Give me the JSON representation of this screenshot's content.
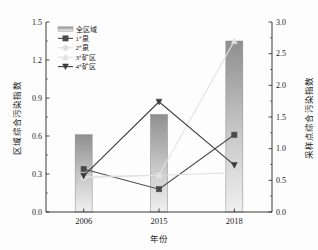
{
  "chart_data": {
    "type": "bar",
    "title": "",
    "subtitle": "",
    "xlabel": "年份",
    "ylabel": "区域综合污染指数",
    "ylabel_right": "采样点综合污染指数",
    "categories": [
      "2006",
      "2015",
      "2018"
    ],
    "ylim": [
      0.0,
      1.5
    ],
    "ylim_right": [
      0.0,
      3.0
    ],
    "yticks": [
      "0.0",
      "0.3",
      "0.6",
      "0.9",
      "1.2",
      "1.5"
    ],
    "ytick_values": [
      0.0,
      0.3,
      0.6,
      0.9,
      1.2,
      1.5
    ],
    "yticks_right": [
      "0.0",
      "0.5",
      "1.0",
      "1.5",
      "2.0",
      "2.5",
      "3.0"
    ],
    "ytick_values_right": [
      0.0,
      0.5,
      1.0,
      1.5,
      2.0,
      2.5,
      3.0
    ],
    "grid": false,
    "legend_position": "upper-left",
    "bar_series": {
      "name": "全区域",
      "axis": "left",
      "values": [
        0.61,
        0.77,
        1.35
      ],
      "color": "#9a9a9a"
    },
    "series": [
      {
        "name": "1#泉",
        "label_main": "泉",
        "label_num": "1",
        "label_sup": "#",
        "axis": "right",
        "values": [
          0.68,
          0.36,
          1.22
        ],
        "values_left_scale": [
          0.34,
          0.18,
          0.61
        ],
        "color": "#4a4a4a",
        "marker": "square"
      },
      {
        "name": "2#泉",
        "label_main": "泉",
        "label_num": "2",
        "label_sup": "#",
        "axis": "right",
        "values": [
          0.54,
          0.58,
          0.62
        ],
        "values_left_scale": [
          0.27,
          0.29,
          0.31
        ],
        "color": "#dedede",
        "marker": "circle"
      },
      {
        "name": "3#矿区",
        "label_main": "矿区",
        "label_num": "3",
        "label_sup": "#",
        "axis": "right",
        "values": [
          0.56,
          0.58,
          2.7
        ],
        "values_left_scale": [
          0.28,
          0.29,
          1.35
        ],
        "color": "#e2e2e2",
        "marker": "triangle-up"
      },
      {
        "name": "4#矿区",
        "label_main": "矿区",
        "label_num": "4",
        "label_sup": "#",
        "axis": "right",
        "values": [
          0.57,
          1.74,
          0.74
        ],
        "values_left_scale": [
          0.285,
          0.87,
          0.37
        ],
        "color": "#3c3c3c",
        "marker": "triangle-down"
      }
    ],
    "legend_entries": [
      {
        "name": "全区域",
        "type": "bar",
        "num": "",
        "sup": "",
        "text": "全区域"
      },
      {
        "name": "1#泉",
        "type": "line-square",
        "num": "1",
        "sup": "#",
        "text": "泉"
      },
      {
        "name": "2#泉",
        "type": "line-circle",
        "num": "2",
        "sup": "#",
        "text": "泉"
      },
      {
        "name": "3#矿区",
        "type": "line-triangle-up",
        "num": "3",
        "sup": "#",
        "text": "矿区"
      },
      {
        "name": "4#矿区",
        "type": "line-triangle-down",
        "num": "4",
        "sup": "#",
        "text": "矿区"
      }
    ]
  }
}
